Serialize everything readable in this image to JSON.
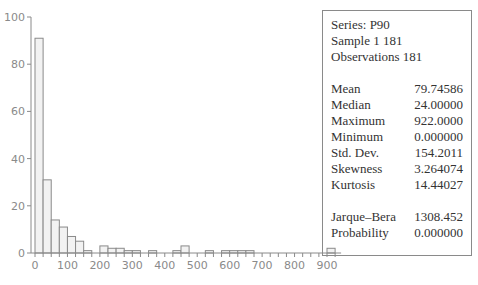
{
  "chart_data": {
    "type": "bar",
    "title": "",
    "xlabel": "",
    "ylabel": "",
    "bin_width": 25,
    "bin_starts": [
      0,
      25,
      50,
      75,
      100,
      125,
      150,
      175,
      200,
      225,
      250,
      275,
      300,
      325,
      350,
      375,
      400,
      425,
      450,
      475,
      500,
      525,
      550,
      575,
      600,
      625,
      650,
      675,
      700,
      725,
      750,
      775,
      800,
      825,
      850,
      875,
      900
    ],
    "values": [
      91,
      31,
      14,
      11,
      7,
      5,
      1,
      0,
      3,
      2,
      2,
      1,
      1,
      0,
      1,
      0,
      0,
      1,
      3,
      0,
      0,
      1,
      0,
      1,
      1,
      1,
      1,
      0,
      0,
      0,
      0,
      0,
      0,
      0,
      0,
      0,
      2
    ],
    "xlim": [
      0,
      925
    ],
    "ylim": [
      0,
      100
    ],
    "x_ticks": [
      "0",
      "100",
      "200",
      "300",
      "400",
      "500",
      "600",
      "700",
      "800",
      "900"
    ],
    "y_ticks": [
      "0",
      "20",
      "40",
      "60",
      "80",
      "100"
    ],
    "grid": false,
    "bar_fill": "#f2f2f2",
    "bar_stroke": "#8a8a8a"
  },
  "stats": {
    "series": "Series: P90",
    "sample": "Sample 1 181",
    "observations": "Observations 181",
    "rows": [
      {
        "label": "Mean",
        "value": "79.74586"
      },
      {
        "label": "Median",
        "value": "24.00000"
      },
      {
        "label": "Maximum",
        "value": "922.0000"
      },
      {
        "label": "Minimum",
        "value": "0.000000"
      },
      {
        "label": "Std. Dev.",
        "value": "154.2011"
      },
      {
        "label": "Skewness",
        "value": "3.264074"
      },
      {
        "label": "Kurtosis",
        "value": "14.44027"
      }
    ],
    "jb_rows": [
      {
        "label": "Jarque–Bera",
        "value": "1308.452"
      },
      {
        "label": "Probability",
        "value": "0.000000"
      }
    ]
  }
}
